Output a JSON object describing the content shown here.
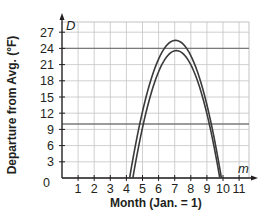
{
  "chart_data": {
    "type": "line",
    "title": "",
    "xlabel": "Month (Jan. = 1)",
    "ylabel": "Departure from Avg. (°F)",
    "x_axis_var": "m",
    "y_axis_var": "D",
    "xlim": [
      0,
      12
    ],
    "ylim": [
      0,
      28
    ],
    "x_ticks": [
      1,
      2,
      3,
      4,
      5,
      6,
      7,
      8,
      9,
      10,
      11
    ],
    "y_ticks": [
      0,
      3,
      6,
      9,
      12,
      15,
      18,
      21,
      24,
      27
    ],
    "grid": true,
    "series": [
      {
        "name": "outer parabola",
        "color": "#3a3a3a",
        "x": [
          4.2,
          5,
          6,
          7,
          7.1,
          8,
          9,
          9.9
        ],
        "y": [
          0,
          11.5,
          22.3,
          25.5,
          25.5,
          23.0,
          14.2,
          0
        ]
      },
      {
        "name": "inner parabola",
        "color": "#3a3a3a",
        "x": [
          4.4,
          5,
          6,
          7,
          7.1,
          8,
          9,
          9.8
        ],
        "y": [
          0,
          9.6,
          20.6,
          23.6,
          23.6,
          21.3,
          12.6,
          0
        ]
      }
    ],
    "horizontal_lines": [
      {
        "y": 24,
        "color": "#7a7a7a"
      },
      {
        "y": 10,
        "color": "#7a7a7a"
      }
    ]
  },
  "labels": {
    "y_axis": "Departure from Avg. (°F)",
    "x_axis": "Month (Jan. = 1)",
    "y_var": "D",
    "x_var": "m",
    "origin": "0"
  }
}
